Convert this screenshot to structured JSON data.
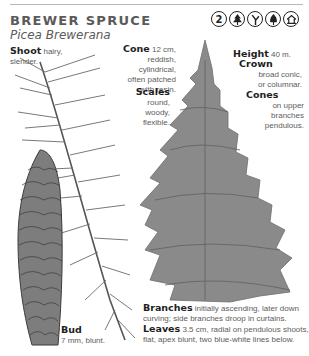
{
  "header": {
    "common_name": "BREWER SPRUCE",
    "scientific_name": "Picea Brewerana",
    "icons": [
      {
        "name": "zone-icon",
        "label": "2"
      },
      {
        "name": "conifer-icon"
      },
      {
        "name": "branching-icon"
      },
      {
        "name": "evergreen-tree-icon"
      },
      {
        "name": "habitat-house-icon"
      }
    ]
  },
  "labels": {
    "shoot": {
      "term": "Shoot",
      "text_1": "hairy,",
      "text_2": "slender."
    },
    "cone": {
      "term": "Cone",
      "text_1": "12 cm,",
      "text_2": "reddish, cylindrical,",
      "text_3": "often patched",
      "text_4": "with resin."
    },
    "scales": {
      "term": "Scales",
      "text_1": "round,",
      "text_2": "woody,",
      "text_3": "flexible."
    },
    "height": {
      "term": "Height",
      "text_1": "40 m."
    },
    "crown": {
      "term": "Crown",
      "text_1": "broad conic,",
      "text_2": "or columnar."
    },
    "cones": {
      "term": "Cones",
      "text_1": "on upper",
      "text_2": "branches",
      "text_3": "pendulous."
    },
    "bud": {
      "term": "Bud",
      "text_1": "7 mm, blunt."
    },
    "branches": {
      "term": "Branches",
      "text_1": "initially ascending, later down",
      "text_2": "curving; side branches droop in curtains."
    },
    "leaves": {
      "term": "Leaves",
      "text_1": "3.5 cm, radial on pendulous shoots,",
      "text_2": "flat, apex blunt, two blue-white lines below."
    }
  }
}
